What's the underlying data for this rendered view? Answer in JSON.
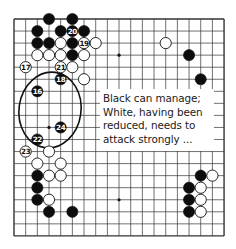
{
  "board": {
    "size": 19,
    "origin": {
      "x": 14,
      "y": 19
    },
    "spacing": {
      "x": 11.67,
      "y": 12.05
    },
    "line_color": "#333333",
    "star_points": [
      [
        3,
        3
      ],
      [
        9,
        3
      ],
      [
        15,
        3
      ],
      [
        3,
        9
      ],
      [
        9,
        9
      ],
      [
        15,
        9
      ],
      [
        3,
        15
      ],
      [
        9,
        15
      ],
      [
        15,
        15
      ]
    ]
  },
  "stones": [
    {
      "col": 3,
      "row": 0,
      "color": "black"
    },
    {
      "col": 5,
      "row": 0,
      "color": "black"
    },
    {
      "col": 2,
      "row": 1,
      "color": "black"
    },
    {
      "col": 4,
      "row": 1,
      "color": "black"
    },
    {
      "col": 5,
      "row": 1,
      "color": "black",
      "label": "20"
    },
    {
      "col": 6,
      "row": 1,
      "color": "black"
    },
    {
      "col": 2,
      "row": 2,
      "color": "black"
    },
    {
      "col": 3,
      "row": 2,
      "color": "black"
    },
    {
      "col": 4,
      "row": 2,
      "color": "white"
    },
    {
      "col": 5,
      "row": 2,
      "color": "black"
    },
    {
      "col": 6,
      "row": 2,
      "color": "white",
      "label": "19"
    },
    {
      "col": 7,
      "row": 2,
      "color": "white"
    },
    {
      "col": 2,
      "row": 3,
      "color": "white"
    },
    {
      "col": 3,
      "row": 3,
      "color": "white"
    },
    {
      "col": 4,
      "row": 3,
      "color": "white"
    },
    {
      "col": 5,
      "row": 3,
      "color": "black"
    },
    {
      "col": 6,
      "row": 3,
      "color": "white"
    },
    {
      "col": 1,
      "row": 4,
      "color": "white",
      "label": "17"
    },
    {
      "col": 4,
      "row": 4,
      "color": "white",
      "label": "21"
    },
    {
      "col": 5,
      "row": 4,
      "color": "white"
    },
    {
      "col": 4,
      "row": 5,
      "color": "black",
      "label": "18"
    },
    {
      "col": 6,
      "row": 5,
      "color": "white"
    },
    {
      "col": 2,
      "row": 6,
      "color": "black",
      "label": "16"
    },
    {
      "col": 4,
      "row": 9,
      "color": "black",
      "label": "24"
    },
    {
      "col": 2,
      "row": 10,
      "color": "black",
      "label": "22"
    },
    {
      "col": 1,
      "row": 11,
      "color": "white",
      "label": "23"
    },
    {
      "col": 3,
      "row": 11,
      "color": "white"
    },
    {
      "col": 2,
      "row": 12,
      "color": "white"
    },
    {
      "col": 4,
      "row": 12,
      "color": "white"
    },
    {
      "col": 2,
      "row": 13,
      "color": "black"
    },
    {
      "col": 3,
      "row": 13,
      "color": "white"
    },
    {
      "col": 4,
      "row": 13,
      "color": "white"
    },
    {
      "col": 2,
      "row": 14,
      "color": "black"
    },
    {
      "col": 2,
      "row": 15,
      "color": "black"
    },
    {
      "col": 3,
      "row": 15,
      "color": "white"
    },
    {
      "col": 3,
      "row": 16,
      "color": "black"
    },
    {
      "col": 5,
      "row": 16,
      "color": "black"
    },
    {
      "col": 13,
      "row": 2,
      "color": "white"
    },
    {
      "col": 15,
      "row": 3,
      "color": "black"
    },
    {
      "col": 16,
      "row": 5,
      "color": "black"
    },
    {
      "col": 16,
      "row": 13,
      "color": "black"
    },
    {
      "col": 17,
      "row": 13,
      "color": "white"
    },
    {
      "col": 15,
      "row": 14,
      "color": "black"
    },
    {
      "col": 16,
      "row": 14,
      "color": "white"
    },
    {
      "col": 15,
      "row": 15,
      "color": "black"
    },
    {
      "col": 16,
      "row": 15,
      "color": "white"
    },
    {
      "col": 15,
      "row": 16,
      "color": "black"
    },
    {
      "col": 16,
      "row": 16,
      "color": "white"
    }
  ],
  "ellipse": {
    "cx": 50,
    "cy": 110,
    "rx": 31,
    "ry": 38,
    "rotate": 8,
    "stroke": "#111111"
  },
  "callout": {
    "lines": [
      "Black can manage;",
      "White, having been",
      "reduced, needs to",
      "attack strongly ..."
    ]
  }
}
